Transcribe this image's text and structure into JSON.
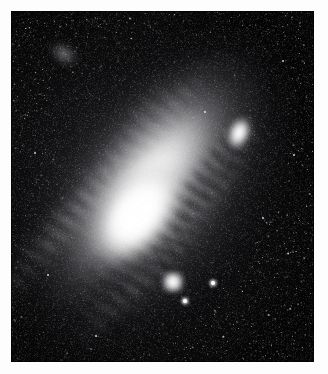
{
  "page": {
    "kind": "astronomical-photograph",
    "medium": "grayscale photographic plate",
    "width": 328,
    "height": 374,
    "background_color": "#fdfdfd"
  },
  "plate": {
    "label": "Andromeda Galaxy photographic plate",
    "x": 11,
    "y": 11,
    "width": 303,
    "height": 351,
    "sky_color": "#050506",
    "border_color": "#000000"
  },
  "objects": [
    {
      "name": "andromeda-galaxy",
      "label": "Andromeda Galaxy (M31)",
      "type": "spiral-galaxy",
      "center_x": 128,
      "center_y": 205,
      "major_axis": 430,
      "minor_axis": 250,
      "position_angle_deg": 38,
      "core_color": "#ffffff",
      "halo_color": "#a8a8aa"
    },
    {
      "name": "companion-m32",
      "label": "M32 companion",
      "type": "elliptical-galaxy",
      "center_x": 228,
      "center_y": 122,
      "major_axis": 44,
      "minor_axis": 30,
      "position_angle_deg": 22,
      "core_color": "#ffffff"
    },
    {
      "name": "companion-ngc205",
      "label": "NGC 205 companion",
      "type": "elliptical-galaxy",
      "center_x": 162,
      "center_y": 271,
      "major_axis": 22,
      "minor_axis": 22,
      "core_color": "#ffffff"
    },
    {
      "name": "star-cloud-ngc206",
      "label": "NGC 206 star cloud",
      "type": "star-cloud",
      "center_x": 53,
      "center_y": 43,
      "core_color": "#bebec0"
    }
  ],
  "bright_stars": [
    {
      "x": 185,
      "y": 301,
      "size": "lg"
    },
    {
      "x": 213,
      "y": 283,
      "size": "lg"
    },
    {
      "x": 48,
      "y": 275,
      "size": "md"
    },
    {
      "x": 35,
      "y": 153,
      "size": "md"
    },
    {
      "x": 42,
      "y": 153,
      "size": "sm"
    },
    {
      "x": 283,
      "y": 61,
      "size": "md"
    },
    {
      "x": 263,
      "y": 218,
      "size": "md"
    },
    {
      "x": 96,
      "y": 336,
      "size": "md"
    },
    {
      "x": 294,
      "y": 155,
      "size": "md"
    },
    {
      "x": 205,
      "y": 112,
      "size": "md"
    }
  ],
  "dust_lanes": [
    {
      "name": "outer-north-lane",
      "opacity": 0.55
    },
    {
      "name": "mid-north-lane",
      "opacity": 0.5
    },
    {
      "name": "inner-lane",
      "opacity": 0.45
    },
    {
      "name": "south-lane",
      "opacity": 0.5
    },
    {
      "name": "south-outer-lane",
      "opacity": 0.45
    }
  ],
  "spiral_arms": [
    {
      "name": "north-arm-outer",
      "brightness": 0.42
    },
    {
      "name": "north-arm-inner",
      "brightness": 0.38
    },
    {
      "name": "south-arm-outer",
      "brightness": 0.4
    },
    {
      "name": "south-arm-inner",
      "brightness": 0.34
    }
  ],
  "grain": {
    "label": "film grain",
    "light_opacity": 0.5,
    "dark_opacity": 0.3,
    "star_field_density": 2600
  }
}
